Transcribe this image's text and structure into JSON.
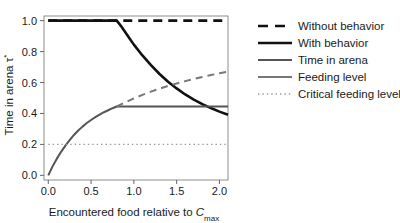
{
  "chart_data": {
    "type": "line",
    "title": "",
    "xlabel": "Encountered food relative to C_max",
    "xlabel_main": "Encountered food relative to ",
    "xlabel_italic": "C",
    "xlabel_sub": "max",
    "ylabel": "Time in arena τ*",
    "ylabel_main": "Time in arena ",
    "ylabel_symbol": "τ",
    "ylabel_superscript": "*",
    "xlim": [
      -0.05,
      2.1
    ],
    "ylim": [
      -0.03,
      1.03
    ],
    "xticks": [
      0.0,
      0.5,
      1.0,
      1.5,
      2.0
    ],
    "xticklabels": [
      "0.0",
      "0.5",
      "1.0",
      "1.5",
      "2.0"
    ],
    "yticks": [
      0.0,
      0.2,
      0.4,
      0.6,
      0.8,
      1.0
    ],
    "yticklabels": [
      "0.0",
      "0.2",
      "0.4",
      "0.6",
      "0.8",
      "1.0"
    ],
    "grid": false,
    "legend_position": "right",
    "series": [
      {
        "name": "Without behavior",
        "style": "dashed",
        "color": "#111111",
        "width": 2.6,
        "x": [
          0.0,
          0.1,
          0.2,
          0.3,
          0.4,
          0.5,
          0.6,
          0.7,
          0.8,
          0.9,
          1.0,
          1.1,
          1.2,
          1.3,
          1.4,
          1.5,
          1.6,
          1.7,
          1.8,
          1.9,
          2.0,
          2.1
        ],
        "y": [
          1.0,
          1.0,
          1.0,
          1.0,
          1.0,
          1.0,
          1.0,
          1.0,
          1.0,
          1.0,
          1.0,
          1.0,
          1.0,
          1.0,
          1.0,
          1.0,
          1.0,
          1.0,
          1.0,
          1.0,
          1.0,
          1.0
        ]
      },
      {
        "name": "With behavior",
        "style": "solid",
        "color": "#111111",
        "width": 2.6,
        "x": [
          0.0,
          0.1,
          0.2,
          0.3,
          0.4,
          0.5,
          0.6,
          0.7,
          0.8,
          0.85,
          0.9,
          0.95,
          1.0,
          1.1,
          1.2,
          1.3,
          1.4,
          1.5,
          1.6,
          1.7,
          1.8,
          1.9,
          2.0,
          2.1
        ],
        "y": [
          1.0,
          1.0,
          1.0,
          1.0,
          1.0,
          1.0,
          1.0,
          1.0,
          1.0,
          0.965,
          0.925,
          0.885,
          0.845,
          0.775,
          0.712,
          0.655,
          0.605,
          0.562,
          0.523,
          0.49,
          0.46,
          0.435,
          0.412,
          0.392
        ]
      },
      {
        "name": "Time in arena",
        "style": "solid",
        "color": "#555555",
        "width": 2.0,
        "x": [
          0.0,
          0.05,
          0.1,
          0.15,
          0.2,
          0.25,
          0.3,
          0.35,
          0.4,
          0.45,
          0.5,
          0.55,
          0.6,
          0.65,
          0.7,
          0.75,
          0.8,
          0.9,
          1.0,
          1.2,
          1.4,
          1.6,
          1.8,
          2.0,
          2.1
        ],
        "y": [
          0.0,
          0.058,
          0.108,
          0.152,
          0.192,
          0.228,
          0.261,
          0.29,
          0.315,
          0.338,
          0.358,
          0.376,
          0.393,
          0.408,
          0.421,
          0.434,
          0.445,
          0.445,
          0.445,
          0.445,
          0.445,
          0.445,
          0.445,
          0.445,
          0.445
        ]
      },
      {
        "name": "Feeding level",
        "style": "dashed",
        "color": "#777777",
        "width": 2.0,
        "x": [
          0.8,
          0.9,
          1.0,
          1.1,
          1.2,
          1.3,
          1.4,
          1.5,
          1.6,
          1.7,
          1.8,
          1.9,
          2.0,
          2.1
        ],
        "y": [
          0.445,
          0.472,
          0.497,
          0.52,
          0.541,
          0.56,
          0.578,
          0.594,
          0.609,
          0.623,
          0.636,
          0.648,
          0.66,
          0.67
        ]
      },
      {
        "name": "Critical feeding level",
        "style": "dotted",
        "color": "#999999",
        "width": 1.4,
        "x": [
          0.0,
          2.1
        ],
        "y": [
          0.2,
          0.2
        ]
      }
    ]
  },
  "legend": {
    "items": [
      {
        "label": "Without behavior",
        "style": "dashed",
        "color": "#111111",
        "width": 2.6
      },
      {
        "label": "With behavior",
        "style": "solid",
        "color": "#111111",
        "width": 2.6
      },
      {
        "label": "Time in arena",
        "style": "solid",
        "color": "#555555",
        "width": 2.2
      },
      {
        "label": "Feeding level",
        "style": "solid",
        "color": "#777777",
        "width": 2.0
      },
      {
        "label": "Critical feeding level",
        "style": "dotted",
        "color": "#999999",
        "width": 1.4
      }
    ]
  },
  "axes": {
    "x_tick_labels": [
      "0.0",
      "0.5",
      "1.0",
      "1.5",
      "2.0"
    ],
    "y_tick_labels": [
      "0.0",
      "0.2",
      "0.4",
      "0.6",
      "0.8",
      "1.0"
    ],
    "x_title_prefix": "Encountered food relative to ",
    "x_title_var": "C",
    "x_title_sub": "max",
    "y_title_prefix": "Time in arena ",
    "y_title_var": "τ",
    "y_title_sup": "*"
  }
}
